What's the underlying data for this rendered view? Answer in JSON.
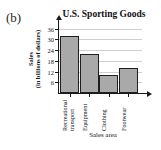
{
  "panel": {
    "label": "(b)"
  },
  "chart_data": {
    "type": "bar",
    "title": "U.S. Sporting Goods",
    "xlabel": "Sales area",
    "ylabel": "Sales (in billions of dollars)",
    "ylabel_lines": [
      "Sales",
      "(in billions of dollars)"
    ],
    "categories": [
      "Recreational transport",
      "Equipment",
      "Clothing",
      "Footwear"
    ],
    "category_lines": [
      [
        "Recreational",
        "transport"
      ],
      [
        "Equipment"
      ],
      [
        "Clothing"
      ],
      [
        "Footwear"
      ]
    ],
    "values": [
      32,
      22,
      10,
      14
    ],
    "yticks": [
      6,
      12,
      18,
      24,
      30,
      36
    ],
    "ytick_labels": [
      "6",
      "12",
      "18",
      "24",
      "30",
      "36"
    ],
    "ylim": [
      0,
      38
    ],
    "grid": true,
    "legend": false,
    "bar_color": "#a9a9a9",
    "bar_border_color": "#1f1f1f",
    "grid_color": "#cfcfcf",
    "axis_color": "#1b1b1b"
  }
}
